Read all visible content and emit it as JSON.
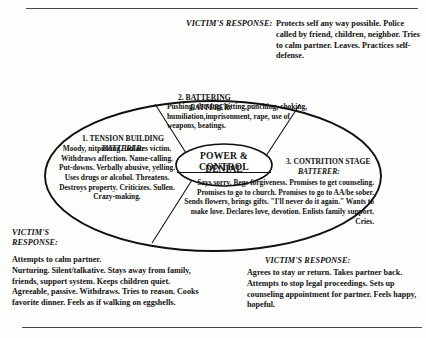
{
  "document": {
    "title": "Cycle of Violence / Power and Control Diagram",
    "has_top_rule": true,
    "has_bottom_rule": true
  },
  "core": {
    "line1": "POWER & CONTROL",
    "line2": "DENIAL"
  },
  "phases": [
    {
      "id": "tension-building",
      "number": "1.",
      "heading": "1. TENSION BUILDING",
      "role_label": "BATTERER:",
      "body": "Moody, nitpicking. Isolates victim. Withdraws affection. Name-calling. Put-downs. Verbally abusive, yelling. Uses drugs or alcohol. Threatens. Destroys property. Criticizes.  Sullen. Crazy-making."
    },
    {
      "id": "battering",
      "number": "2.",
      "heading": "2. BATTERING",
      "role_label": "BATTERER:",
      "body": "Pushing, shoving, hitting,punching, choking, humiliation,imprisonment, rape, use of weapons, beatings."
    },
    {
      "id": "contrition-stage",
      "number": "3.",
      "heading": "3. CONTRITION STAGE",
      "role_label": "BATTERER:",
      "body": "Says sorry.  Begs forgiveness.  Promises to get counseling. Promises to go to church.  Promises to go to AA/be sober.  Sends flowers, brings gifts. \"I'll never do it again.\"  Wants to make love. Declares love, devotion. Enlists family support. Cries."
    }
  ],
  "victim_responses": [
    {
      "id": "victim-response-top",
      "label": "VICTIM'S RESPONSE:",
      "body": "Protects self any way  possible. Police called by friend, children, neighbor. Tries to calm partner. Leaves. Practices self-defense."
    },
    {
      "id": "victim-response-left",
      "label": "VICTIM'S\nRESPONSE:",
      "body": "Attempts to calm partner.\nNurturing. Silent/talkative. Stays away from family, friends, support system. Keeps children quiet. Agreeable, passive. Withdraws. Tries to reason. Cooks favorite dinner. Feels as if walking on eggshells."
    },
    {
      "id": "victim-response-right",
      "label": "VICTIM'S RESPONSE:",
      "body": "Agrees to stay or return. Takes partner back. Attempts to stop legal proceedings. Sets up counseling appointment for partner. Feels happy, hopeful."
    }
  ],
  "colors": {
    "ink": "#121212",
    "rule": "#4a4a4a",
    "paper": "#fdfdfc"
  }
}
